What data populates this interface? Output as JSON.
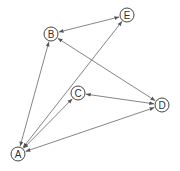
{
  "diagram": {
    "type": "graph",
    "directed": "bidirectional",
    "nodes": [
      {
        "id": "A",
        "label": "A",
        "x": 18,
        "y": 154
      },
      {
        "id": "B",
        "label": "B",
        "x": 51,
        "y": 34
      },
      {
        "id": "C",
        "label": "C",
        "x": 78,
        "y": 93
      },
      {
        "id": "D",
        "label": "D",
        "x": 162,
        "y": 105
      },
      {
        "id": "E",
        "label": "E",
        "x": 127,
        "y": 15
      }
    ],
    "edges": [
      {
        "from": "A",
        "to": "B"
      },
      {
        "from": "A",
        "to": "C"
      },
      {
        "from": "A",
        "to": "D"
      },
      {
        "from": "A",
        "to": "E"
      },
      {
        "from": "B",
        "to": "E"
      },
      {
        "from": "B",
        "to": "D"
      },
      {
        "from": "C",
        "to": "D"
      }
    ],
    "colors": {
      "edge": "#666666",
      "node_stroke": "#444444",
      "text": "#333333"
    }
  }
}
